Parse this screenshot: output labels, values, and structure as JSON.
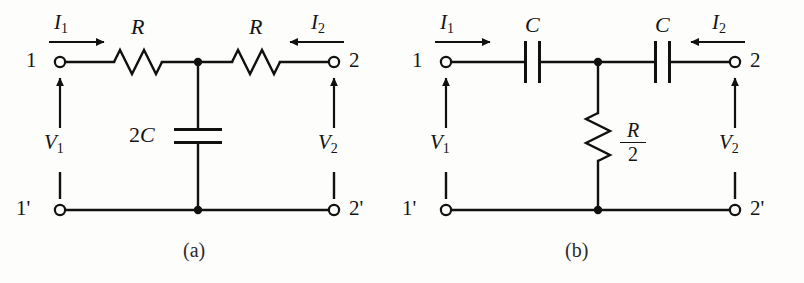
{
  "figure": {
    "type": "circuit-diagram",
    "background_color": "#fdfdfb",
    "line_color": "#111111"
  },
  "circuit_a": {
    "caption": "(a)",
    "terminals": {
      "input_top": "1",
      "input_bottom": "1'",
      "output_top": "2",
      "output_bottom": "2'"
    },
    "currents": {
      "input": "I",
      "input_sub": "1",
      "input_direction": "right",
      "output": "I",
      "output_sub": "2",
      "output_direction": "left"
    },
    "voltages": {
      "input": "V",
      "input_sub": "1",
      "output": "V",
      "output_sub": "2"
    },
    "components": [
      {
        "name": "series-resistor-left",
        "type": "resistor",
        "label": "R",
        "orientation": "horizontal"
      },
      {
        "name": "series-resistor-right",
        "type": "resistor",
        "label": "R",
        "orientation": "horizontal"
      },
      {
        "name": "shunt-capacitor",
        "type": "capacitor",
        "label_num": "2",
        "label_sym": "C",
        "orientation": "horizontal-plates"
      }
    ]
  },
  "circuit_b": {
    "caption": "(b)",
    "terminals": {
      "input_top": "1",
      "input_bottom": "1'",
      "output_top": "2",
      "output_bottom": "2'"
    },
    "currents": {
      "input": "I",
      "input_sub": "1",
      "input_direction": "right",
      "output": "I",
      "output_sub": "2",
      "output_direction": "left"
    },
    "voltages": {
      "input": "V",
      "input_sub": "1",
      "output": "V",
      "output_sub": "2"
    },
    "components": [
      {
        "name": "series-capacitor-left",
        "type": "capacitor",
        "label": "C",
        "orientation": "vertical-plates"
      },
      {
        "name": "series-capacitor-right",
        "type": "capacitor",
        "label": "C",
        "orientation": "vertical-plates"
      },
      {
        "name": "shunt-resistor",
        "type": "resistor",
        "label_numerator": "R",
        "label_denominator": "2",
        "orientation": "vertical"
      }
    ]
  }
}
